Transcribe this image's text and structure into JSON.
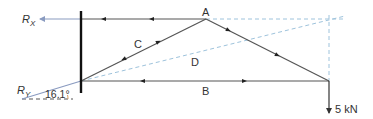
{
  "diagram": {
    "title": "",
    "labels": {
      "rx_main": "R",
      "rx_sub": "X",
      "ry_main": "R",
      "ry_sub": "Y",
      "angle": "16.1°",
      "node_a": "A",
      "member_b": "B",
      "member_c": "C",
      "member_d": "D",
      "load": "5 kN"
    },
    "nodes": [
      {
        "id": "wall-top",
        "x": 81,
        "y": 18
      },
      {
        "id": "A",
        "x": 206,
        "y": 19
      },
      {
        "id": "support",
        "x": 81,
        "y": 81
      },
      {
        "id": "tip",
        "x": 329,
        "y": 81
      }
    ],
    "members": [
      {
        "id": "top-chord",
        "from": "wall-top",
        "to": "A"
      },
      {
        "id": "C",
        "from": "support",
        "to": "A"
      },
      {
        "id": "A-tip",
        "from": "A",
        "to": "tip"
      },
      {
        "id": "B",
        "from": "support",
        "to": "tip"
      }
    ],
    "load": {
      "value": 5,
      "unit": "kN",
      "direction": "down"
    },
    "reaction_angle_deg": 16.1,
    "colors": {
      "member": "#555555",
      "wall": "#111111",
      "reaction": "#8a9bc0",
      "construction": "#9ec3dc",
      "text": "#333333"
    }
  }
}
